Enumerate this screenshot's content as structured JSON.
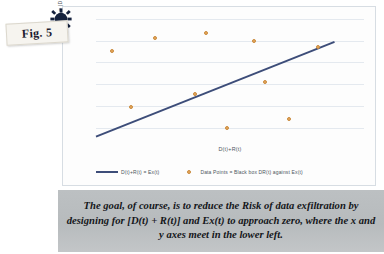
{
  "figure": {
    "tag_label": "Fig. 5",
    "gear_icon_name": "gear-icon"
  },
  "caption": {
    "text": "The goal, of course, is to reduce the Risk of data exfiltration by designing for [D(t) + R(t)] and Ex(t) to approach zero, where the x and y axes meet in the lower left."
  },
  "legend": {
    "line_label": "D(t)+R(t) = Ex(t)",
    "points_label": "Data Points = Black box DR(t) against Ex(t)"
  },
  "colors": {
    "line": "#3d4d79",
    "points": "#e8a95c",
    "gridline": "#e4e9ef",
    "caption_bg": "#bcc0c2",
    "card_bg": "#fdfdfd"
  },
  "chart_data": {
    "type": "scatter",
    "title": "",
    "xlabel": "D(t)+R(t)",
    "ylabel": "Ex(t) = |DB| / BW",
    "xlim": [
      0,
      100
    ],
    "ylim": [
      0,
      100
    ],
    "grid": true,
    "x_ticks": [],
    "y_ticks": [],
    "gridlines_y": [
      12,
      29,
      46,
      63,
      80,
      97
    ],
    "legend_position": "bottom",
    "series": [
      {
        "name": "Data Points = Black box DR(t) against Ex(t)",
        "type": "scatter",
        "color": "#e8a95c",
        "points": [
          {
            "x": 6,
            "y": 72
          },
          {
            "x": 22,
            "y": 82
          },
          {
            "x": 13,
            "y": 28
          },
          {
            "x": 41,
            "y": 86
          },
          {
            "x": 37,
            "y": 38
          },
          {
            "x": 49,
            "y": 12
          },
          {
            "x": 59,
            "y": 80
          },
          {
            "x": 63,
            "y": 48
          },
          {
            "x": 72,
            "y": 19
          },
          {
            "x": 83,
            "y": 75
          }
        ]
      },
      {
        "name": "D(t)+R(t) = Ex(t)",
        "type": "line",
        "color": "#3d4d79",
        "points": [
          {
            "x": 0,
            "y": 5
          },
          {
            "x": 89,
            "y": 79
          }
        ]
      }
    ]
  }
}
